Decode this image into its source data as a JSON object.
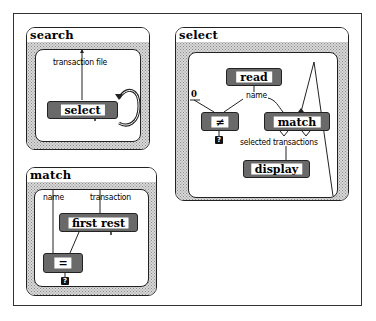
{
  "panels": {
    "search": {
      "title": "search",
      "input_label": "transaction file",
      "operation": "select"
    },
    "select": {
      "title": "select",
      "constant": "0",
      "read_op": "read",
      "name_label": "name",
      "not_equal_op": "≠",
      "match_op": "match",
      "output_label": "selected transactions",
      "display_op": "display",
      "question_mark": "?"
    },
    "match": {
      "title": "match",
      "input_name_label": "name",
      "input_transaction_label": "transaction",
      "first_rest_op": "first rest",
      "equal_op": "=",
      "question_mark": "?"
    }
  },
  "colors": {
    "line": "#222222",
    "shade": "#7a7a7a",
    "background": "#ffffff"
  }
}
